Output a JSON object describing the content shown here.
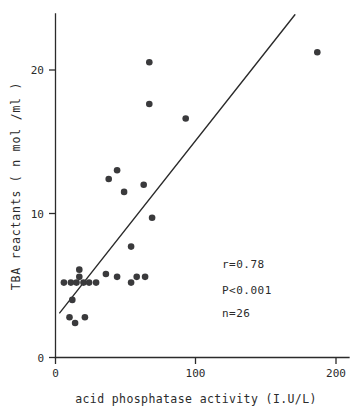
{
  "chart_data": {
    "type": "scatter",
    "title": "",
    "xlabel": "acid phosphatase activity (I.U/L)",
    "ylabel": "TBA reactants ( n mol /ml )",
    "xlim": [
      0,
      210
    ],
    "ylim": [
      0,
      23.5
    ],
    "xticks": [
      0,
      100,
      200
    ],
    "xticklabels": [
      "0",
      "100",
      "200"
    ],
    "yticks": [
      0,
      10,
      20
    ],
    "yticklabels": [
      "0",
      "10",
      "20"
    ],
    "grid": false,
    "legend": null,
    "marker": "filled-circle",
    "marker_color": "#3a3a3c",
    "points": [
      {
        "x": 10,
        "y": 2.8
      },
      {
        "x": 14,
        "y": 2.4
      },
      {
        "x": 21,
        "y": 2.8
      },
      {
        "x": 12,
        "y": 4.0
      },
      {
        "x": 6,
        "y": 5.2
      },
      {
        "x": 11,
        "y": 5.2
      },
      {
        "x": 15,
        "y": 5.2
      },
      {
        "x": 20,
        "y": 5.2
      },
      {
        "x": 24,
        "y": 5.2
      },
      {
        "x": 29,
        "y": 5.2
      },
      {
        "x": 17,
        "y": 6.1
      },
      {
        "x": 17,
        "y": 5.6
      },
      {
        "x": 36,
        "y": 5.8
      },
      {
        "x": 44,
        "y": 5.6
      },
      {
        "x": 54,
        "y": 5.2
      },
      {
        "x": 58,
        "y": 5.6
      },
      {
        "x": 64,
        "y": 5.6
      },
      {
        "x": 54,
        "y": 7.7
      },
      {
        "x": 69,
        "y": 9.7
      },
      {
        "x": 49,
        "y": 11.5
      },
      {
        "x": 38,
        "y": 12.4
      },
      {
        "x": 63,
        "y": 12.0
      },
      {
        "x": 44,
        "y": 13.0
      },
      {
        "x": 93,
        "y": 16.6
      },
      {
        "x": 67,
        "y": 17.6
      },
      {
        "x": 67,
        "y": 20.5
      },
      {
        "x": 187,
        "y": 21.2
      }
    ],
    "fit_line": {
      "type": "linear-regression",
      "x_start": 3,
      "y_start": 3.1,
      "x_end": 171,
      "y_end": 23.8
    },
    "annotations": [
      {
        "name": "correlation",
        "text": "r=0.78"
      },
      {
        "name": "p-value",
        "text": "P<0.001"
      },
      {
        "name": "sample-size",
        "text": "n=26"
      }
    ]
  },
  "annotations": {
    "r": "r=0.78",
    "p": "P<0.001",
    "n": "n=26"
  },
  "axes": {
    "x_title": "acid phosphatase activity (I.U/L)",
    "y_title": "TBA reactants ( n mol /ml )",
    "x_tick_0": "0",
    "x_tick_1": "100",
    "x_tick_2": "200",
    "y_tick_0": "0",
    "y_tick_1": "10",
    "y_tick_2": "20"
  }
}
